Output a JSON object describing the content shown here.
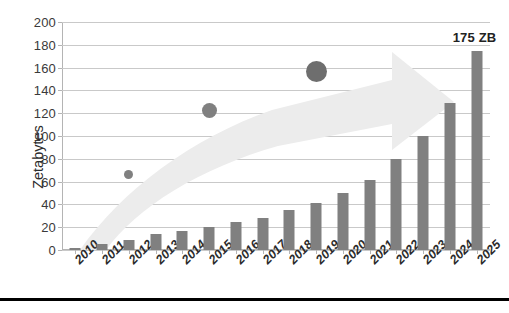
{
  "chart_data": {
    "type": "bar",
    "title": "",
    "xlabel": "",
    "ylabel": "Zetabytes",
    "ylim": [
      0,
      200
    ],
    "ytick_step": 20,
    "yticks": [
      0,
      20,
      40,
      60,
      80,
      100,
      120,
      140,
      160,
      180,
      200
    ],
    "grid": true,
    "legend": "none",
    "categories": [
      "2010",
      "2011",
      "2012",
      "2013",
      "2014",
      "2015",
      "2016",
      "2017",
      "2018",
      "2019",
      "2020",
      "2021",
      "2022",
      "2023",
      "2024",
      "2025"
    ],
    "values": [
      2,
      5,
      9,
      14,
      17,
      20,
      25,
      28,
      35,
      41,
      50,
      61,
      80,
      100,
      129,
      175
    ],
    "annotations": [
      {
        "text": "175 ZB",
        "category": "2025",
        "value": 175
      }
    ],
    "overlays": {
      "arrow": {
        "shape": "tapering-upward-arrow",
        "color": "#ececec",
        "direction": "left-to-right-rising"
      },
      "bubbles": [
        {
          "category": "2012",
          "value": 66,
          "size": "small",
          "color": "#808080"
        },
        {
          "category": "2015",
          "value": 122,
          "size": "medium",
          "color": "#808080"
        },
        {
          "category": "2019",
          "value": 157,
          "size": "large",
          "color": "#6e6e6e"
        }
      ]
    }
  },
  "colors": {
    "bar": "#808080",
    "gridline": "#c9c9c9",
    "arrow": "#ececec",
    "bubble": "#808080",
    "bubble_large": "#6e6e6e",
    "axis_text": "#2b2b2b",
    "rule": "#000000"
  },
  "footer": {
    "rule_present": true,
    "caption": ""
  }
}
